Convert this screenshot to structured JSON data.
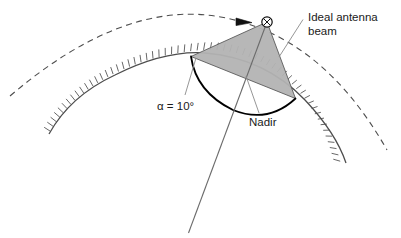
{
  "figure": {
    "width": 401,
    "height": 238,
    "background_color": "#ffffff"
  },
  "labels": {
    "antenna_beam_line1": "Ideal antenna",
    "antenna_beam_line2": "beam",
    "alpha": "α = 10°",
    "nadir": "Nadir"
  },
  "colors": {
    "beam_fill": "#b3b3b3",
    "beam_stroke": "#4d4d4d",
    "earth_stroke": "#4d4d4d",
    "orbit_stroke": "#4d4d4d",
    "swath_stroke": "#000000",
    "nadir_stroke": "#6b6b6b",
    "leader_stroke": "#8a8a8a",
    "text": "#1a1a1a"
  },
  "elements": {
    "orbit_arc_name": "satellite-orbit-dashed-arc",
    "orbit_direction_arrow_name": "orbit-direction-arrowhead",
    "satellite_marker_name": "satellite-marker",
    "earth_surface_name": "earth-surface-hatched-arc",
    "beam_triangle_name": "ideal-antenna-beam-triangle",
    "swath_arc_name": "ground-swath-arc",
    "nadir_line_name": "nadir-line"
  },
  "geometry": {
    "satellite_x": 267,
    "satellite_y": 22,
    "nadir_angle_deg": 10,
    "beam_left_footprint": [
      191,
      57
    ],
    "beam_right_footprint": [
      295,
      98
    ]
  }
}
